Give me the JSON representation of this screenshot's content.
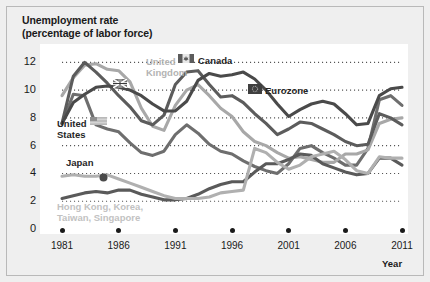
{
  "chart_data": {
    "type": "line",
    "title": "Unemployment rate",
    "subtitle": "(percentage of labor force)",
    "xlabel": "Year",
    "ylabel": "",
    "xlim": [
      1981,
      2011
    ],
    "ylim": [
      0,
      12.6
    ],
    "yticks": [
      0,
      2,
      4,
      6,
      8,
      10,
      12
    ],
    "xticks": [
      1981,
      1986,
      1991,
      1996,
      2001,
      2006,
      2011
    ],
    "grid": "horizontal-dotted",
    "legend": "inline-annotations",
    "x": [
      1981,
      1982,
      1983,
      1984,
      1985,
      1986,
      1987,
      1988,
      1989,
      1990,
      1991,
      1992,
      1993,
      1994,
      1995,
      1996,
      1997,
      1998,
      1999,
      2000,
      2001,
      2002,
      2003,
      2004,
      2005,
      2006,
      2007,
      2008,
      2009,
      2010,
      2011
    ],
    "series": [
      {
        "name": "United States",
        "color": "#6e6e6e",
        "label": "United States",
        "label_color": "#262626",
        "marker": "us-flag-marker",
        "values": [
          7.6,
          9.7,
          9.6,
          7.5,
          7.2,
          7.0,
          6.2,
          5.5,
          5.3,
          5.6,
          6.8,
          7.5,
          6.9,
          6.1,
          5.6,
          5.4,
          4.9,
          4.5,
          4.2,
          4.0,
          4.7,
          5.8,
          6.0,
          5.5,
          5.1,
          4.6,
          4.6,
          5.8,
          9.3,
          9.6,
          8.9
        ]
      },
      {
        "name": "United Kingdom",
        "color": "#a8a8a8",
        "label": "United Kingdom",
        "label_color": "#b3b3b3",
        "marker": "uk-flag-marker",
        "values": [
          9.6,
          10.9,
          11.8,
          11.9,
          11.5,
          11.4,
          10.6,
          8.7,
          7.4,
          7.1,
          8.9,
          10.0,
          10.4,
          9.6,
          8.7,
          8.1,
          7.0,
          6.3,
          6.0,
          5.5,
          5.1,
          5.2,
          5.0,
          4.8,
          4.8,
          5.4,
          5.4,
          5.7,
          7.6,
          7.9,
          8.0
        ]
      },
      {
        "name": "Canada",
        "color": "#5c5c5c",
        "label": "Canada",
        "label_color": "#262626",
        "marker": "canada-flag-marker",
        "values": [
          7.6,
          11.0,
          12.0,
          11.3,
          10.5,
          9.6,
          8.8,
          7.8,
          7.5,
          8.2,
          10.4,
          11.3,
          11.4,
          10.4,
          9.5,
          9.6,
          9.1,
          8.3,
          7.6,
          6.8,
          7.2,
          7.7,
          7.6,
          7.2,
          6.8,
          6.3,
          6.0,
          6.1,
          8.3,
          8.0,
          7.5
        ]
      },
      {
        "name": "Eurozone",
        "color": "#4a4a4a",
        "label": "Eurozone",
        "label_color": "#262626",
        "marker": "eurozone-flag-marker",
        "values": [
          7.6,
          9.1,
          9.7,
          10.2,
          10.3,
          10.2,
          10.0,
          9.6,
          9.0,
          8.5,
          8.5,
          9.2,
          10.7,
          11.2,
          11.0,
          11.1,
          11.3,
          10.8,
          10.0,
          9.0,
          8.1,
          8.6,
          9.0,
          9.2,
          9.0,
          8.3,
          7.5,
          7.6,
          9.6,
          10.1,
          10.2
        ]
      },
      {
        "name": "Japan",
        "color": "#5a5a5a",
        "label": "Japan",
        "label_color": "#262626",
        "marker": "japan-dot-marker",
        "values": [
          2.2,
          2.4,
          2.6,
          2.7,
          2.6,
          2.8,
          2.8,
          2.5,
          2.3,
          2.1,
          2.1,
          2.2,
          2.5,
          2.9,
          3.2,
          3.4,
          3.4,
          4.1,
          4.7,
          4.7,
          5.0,
          5.4,
          5.3,
          4.7,
          4.4,
          4.1,
          3.9,
          4.0,
          5.1,
          5.1,
          4.6
        ]
      },
      {
        "name": "Hong Kong, Korea, Taiwan, Singapore",
        "color": "#b0b0b0",
        "label": "Hong Kong, Korea, Taiwan, Singapore",
        "label_color": "#c7c7c7",
        "marker": "none",
        "values": [
          3.8,
          3.9,
          3.8,
          3.8,
          3.9,
          3.6,
          3.3,
          3.0,
          2.7,
          2.4,
          2.2,
          2.2,
          2.2,
          2.3,
          2.6,
          2.7,
          2.8,
          5.8,
          5.5,
          4.8,
          4.3,
          4.6,
          5.2,
          5.4,
          5.6,
          5.0,
          4.2,
          4.0,
          5.2,
          5.1,
          5.1
        ]
      }
    ],
    "annotations": [
      {
        "name": "united-kingdom-label",
        "text_line1": "United",
        "text_line2": "Kingdom"
      },
      {
        "name": "canada-label",
        "text": "Canada"
      },
      {
        "name": "eurozone-label",
        "text": "Eurozone"
      },
      {
        "name": "united-states-label",
        "text_line1": "United",
        "text_line2": "States"
      },
      {
        "name": "japan-label",
        "text": "Japan"
      },
      {
        "name": "tigers-label",
        "text_line1": "Hong Kong, Korea,",
        "text_line2": "Taiwan, Singapore"
      }
    ]
  },
  "labels": {
    "title": "Unemployment rate",
    "subtitle": "(percentage of labor force)",
    "year_axis": "Year",
    "uk_line1": "United",
    "uk_line2": "Kingdom",
    "canada": "Canada",
    "eurozone": "Eurozone",
    "us_line1": "United",
    "us_line2": "States",
    "japan": "Japan",
    "tigers_line1": "Hong Kong, Korea,",
    "tigers_line2": "Taiwan, Singapore"
  },
  "colors": {
    "background": "#efefef",
    "plot_background": "#ffffff",
    "gridline": "#555555",
    "axis_text": "#1a1a1a"
  }
}
